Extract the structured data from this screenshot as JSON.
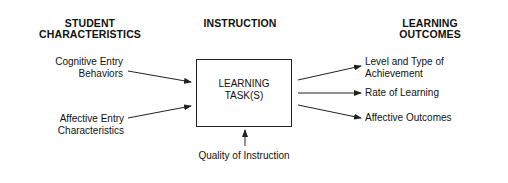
{
  "headers": {
    "student": [
      "STUDENT",
      "CHARACTERISTICS"
    ],
    "instruction": "INSTRUCTION",
    "outcomes": [
      "LEARNING",
      "OUTCOMES"
    ]
  },
  "inputs": {
    "cognitive": [
      "Cognitive Entry",
      "Behaviors"
    ],
    "affective": [
      "Affective Entry",
      "Characteristics"
    ],
    "quality": "Quality of Instruction"
  },
  "center_box": [
    "LEARNING",
    "TASK(S)"
  ],
  "outputs": {
    "achievement": [
      "Level and Type of",
      "Achievement"
    ],
    "rate": "Rate of Learning",
    "affective": "Affective Outcomes"
  },
  "colors": {
    "line": "#222222",
    "text": "#111111",
    "background": "#ffffff"
  }
}
